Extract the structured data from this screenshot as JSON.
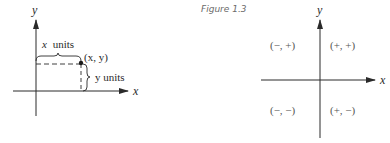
{
  "caption": "Figure 1.3",
  "left_figure": {
    "x_axis_label": "x",
    "y_axis_label": "y",
    "x_units_label": "x units",
    "y_units_label": "y units",
    "point_label": "(x, y)",
    "x_units_italic": "x",
    "x_units_word": "units",
    "y_units_word": "y units"
  },
  "right_figure": {
    "x_axis_label": "x",
    "y_axis_label": "y",
    "quadrants": {
      "q1": "(+, +)",
      "q2": "(−, +)",
      "q3": "(−, −)",
      "q4": "(+, −)"
    }
  },
  "colors": {
    "ink": "#2a2a2a",
    "caption": "#6a6a6a",
    "label": "#555555"
  }
}
